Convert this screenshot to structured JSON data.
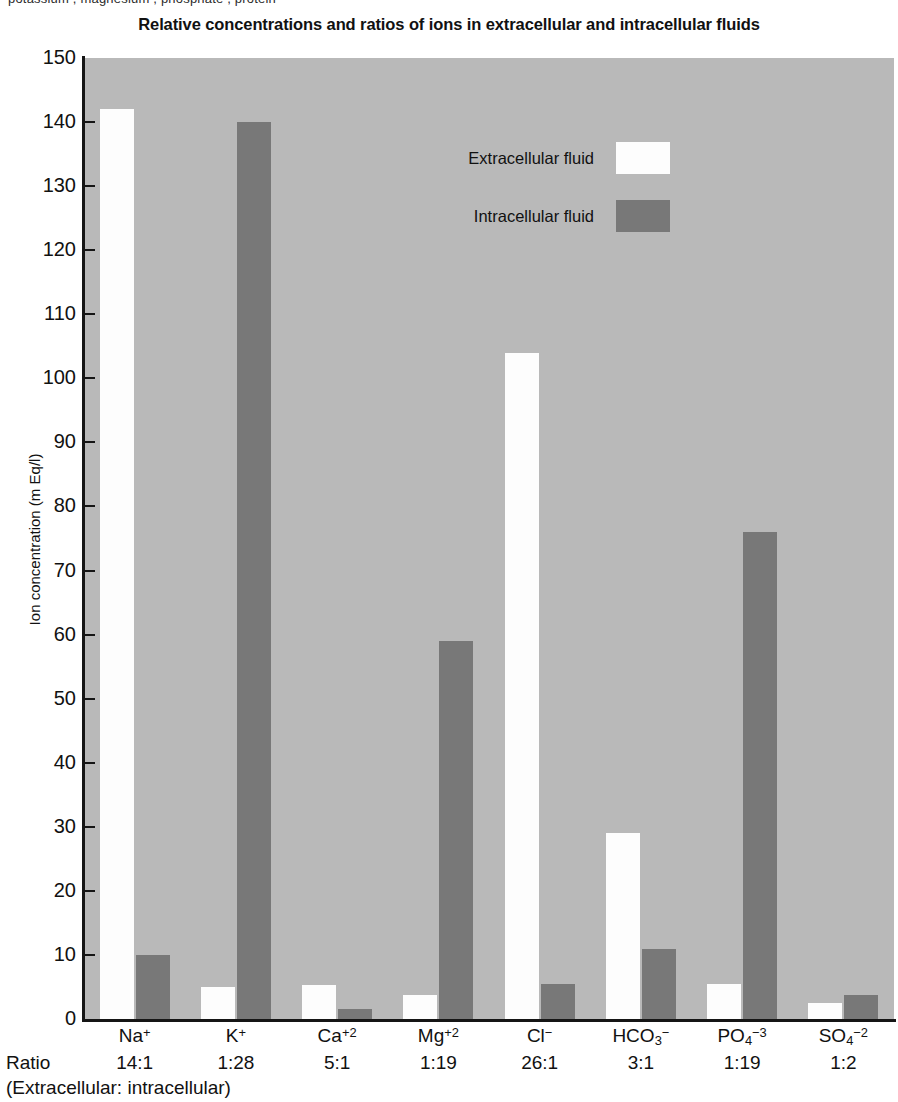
{
  "top_sliver": {
    "text": "potassium , magnesium , phosphate , protein"
  },
  "chart_data": {
    "type": "bar",
    "title": "Relative concentrations and ratios of ions in extracellular and intracellular fluids",
    "xlabel": "",
    "ylabel": "Ion concentration (m Eq/l)",
    "ylim": [
      0,
      150
    ],
    "ytick_step": 10,
    "yticks": [
      0,
      10,
      20,
      30,
      40,
      50,
      60,
      70,
      80,
      90,
      100,
      110,
      120,
      130,
      140,
      150
    ],
    "grid": false,
    "legend_position": "upper-center",
    "categories": [
      "Na",
      "K",
      "Ca",
      "Mg",
      "Cl",
      "HCO3",
      "PO4",
      "SO4"
    ],
    "category_labels": [
      {
        "base": "Na",
        "sub": "",
        "sup": "+"
      },
      {
        "base": "K",
        "sub": "",
        "sup": "+"
      },
      {
        "base": "Ca",
        "sub": "",
        "sup": "+2"
      },
      {
        "base": "Mg",
        "sub": "",
        "sup": "+2"
      },
      {
        "base": "Cl",
        "sub": "",
        "sup": "−"
      },
      {
        "base": "HCO",
        "sub": "3",
        "sup": "−"
      },
      {
        "base": "PO",
        "sub": "4",
        "sup": "−3"
      },
      {
        "base": "SO",
        "sub": "4",
        "sup": "−2"
      }
    ],
    "ratios": [
      "14:1",
      "1:28",
      "5:1",
      "1:19",
      "26:1",
      "3:1",
      "1:19",
      "1:2"
    ],
    "ratio_caption": "Ratio",
    "ratio_subcaption": "(Extracellular: intracellular)",
    "series": [
      {
        "name": "Extracellular fluid",
        "color": "#fdfdfd",
        "values": [
          142,
          5,
          5.3,
          3.8,
          104,
          29,
          5.5,
          2.5
        ]
      },
      {
        "name": "Intracellular fluid",
        "color": "#787878",
        "values": [
          10,
          140,
          1.5,
          59,
          5.5,
          11,
          76,
          3.8
        ]
      }
    ]
  },
  "legend": {
    "items": [
      {
        "label": "Extracellular fluid",
        "swatch": "extracellular"
      },
      {
        "label": "Intracellular fluid",
        "swatch": "intracellular"
      }
    ]
  },
  "colors": {
    "plot_background": "#b9b9b9",
    "extracellular": "#fdfdfd",
    "intracellular": "#787878",
    "axis": "#151515",
    "text": "#111111"
  }
}
